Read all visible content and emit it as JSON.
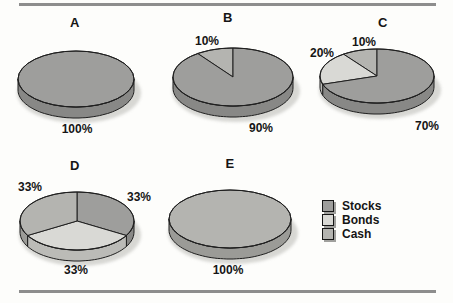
{
  "figure": {
    "background_color": "#fdfdfb",
    "rule_color": "#8d8d8d",
    "outline_color": "#1f1f1f"
  },
  "legend": {
    "position": "bottom-right",
    "items": [
      {
        "label": "Stocks",
        "color": "#9e9e9c"
      },
      {
        "label": "Bonds",
        "color": "#d9d9d5"
      },
      {
        "label": "Cash",
        "color": "#b4b4b0"
      }
    ]
  },
  "chart_data": {
    "type": "pie",
    "style": "3d-ellipse",
    "legend_entries": [
      "Stocks",
      "Bonds",
      "Cash"
    ],
    "pies": [
      {
        "title": "A",
        "direction": "ccw",
        "slices": [
          {
            "label": "Stocks",
            "value": 100,
            "text": "100%"
          }
        ]
      },
      {
        "title": "B",
        "direction": "ccw",
        "slices": [
          {
            "label": "Cash",
            "value": 10,
            "text": "10%"
          },
          {
            "label": "Stocks",
            "value": 90,
            "text": "90%"
          }
        ]
      },
      {
        "title": "C",
        "direction": "ccw",
        "slices": [
          {
            "label": "Cash",
            "value": 10,
            "text": "10%"
          },
          {
            "label": "Bonds",
            "value": 20,
            "text": "20%"
          },
          {
            "label": "Stocks",
            "value": 70,
            "text": "70%"
          }
        ]
      },
      {
        "title": "D",
        "direction": "cw",
        "slices": [
          {
            "label": "Stocks",
            "value": 33,
            "text": "33%"
          },
          {
            "label": "Bonds",
            "value": 33,
            "text": "33%"
          },
          {
            "label": "Cash",
            "value": 33,
            "text": "33%"
          }
        ]
      },
      {
        "title": "E",
        "direction": "ccw",
        "slices": [
          {
            "label": "Cash",
            "value": 100,
            "text": "100%"
          }
        ]
      }
    ]
  }
}
